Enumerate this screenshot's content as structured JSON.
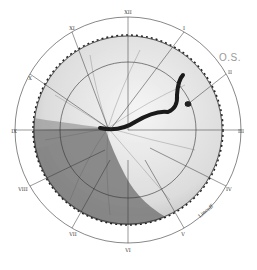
{
  "diagram": {
    "type": "retinal fundus drawing",
    "eye_label": "O.S.",
    "clock_hours": [
      "XII",
      "I",
      "II",
      "III",
      "IV",
      "V",
      "VI",
      "VII",
      "VIII",
      "IX",
      "X",
      "XI"
    ],
    "signature": "Lincoff",
    "colors": {
      "ink": "#222222",
      "detached_shade": "#6e6e6e",
      "attached_retina": "#e8e8e8",
      "label_gray": "#9a9a9a"
    }
  }
}
